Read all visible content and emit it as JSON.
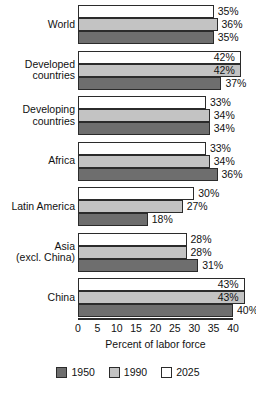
{
  "chart_data": {
    "type": "bar",
    "orientation": "horizontal",
    "title": "",
    "xlabel": "Percent of labor force",
    "ylabel": "",
    "xlim": [
      0,
      40
    ],
    "grid": false,
    "legend_position": "bottom",
    "categories": [
      "World",
      "Developed\ncountries",
      "Developing\ncountries",
      "Africa",
      "Latin America",
      "Asia\n(excl. China)",
      "China"
    ],
    "series": [
      {
        "name": "2025",
        "color": "#ffffff",
        "values": [
          35,
          42,
          33,
          33,
          30,
          28,
          43
        ]
      },
      {
        "name": "1990",
        "color": "#c3c3c3",
        "values": [
          36,
          42,
          34,
          34,
          27,
          28,
          43
        ]
      },
      {
        "name": "1950",
        "color": "#6e6e6e",
        "values": [
          35,
          37,
          34,
          36,
          18,
          31,
          40
        ]
      }
    ],
    "value_labels": [
      [
        "35%",
        "36%",
        "35%"
      ],
      [
        "42%",
        "42%",
        "37%"
      ],
      [
        "33%",
        "34%",
        "34%"
      ],
      [
        "33%",
        "34%",
        "36%"
      ],
      [
        "30%",
        "27%",
        "18%"
      ],
      [
        "28%",
        "28%",
        "31%"
      ],
      [
        "43%",
        "43%",
        "40%"
      ]
    ],
    "x_ticks": [
      0,
      5,
      10,
      15,
      20,
      25,
      30,
      35,
      40
    ],
    "x_tick_labels": [
      "0",
      "5",
      "10",
      "15",
      "20",
      "25",
      "30",
      "35",
      "40"
    ]
  },
  "legend": {
    "items": [
      {
        "label": "1950",
        "color": "#6e6e6e"
      },
      {
        "label": "1990",
        "color": "#c3c3c3"
      },
      {
        "label": "2025",
        "color": "#ffffff"
      }
    ]
  }
}
